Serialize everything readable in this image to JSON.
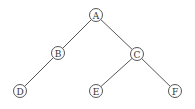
{
  "diagram": {
    "type": "binary-tree",
    "nodes": [
      {
        "id": "A",
        "label": "A"
      },
      {
        "id": "B",
        "label": "B"
      },
      {
        "id": "C",
        "label": "C"
      },
      {
        "id": "D",
        "label": "D"
      },
      {
        "id": "E",
        "label": "E"
      },
      {
        "id": "F",
        "label": "F"
      }
    ],
    "edges": [
      {
        "from": "A",
        "to": "B"
      },
      {
        "from": "A",
        "to": "C"
      },
      {
        "from": "B",
        "to": "D"
      },
      {
        "from": "C",
        "to": "E"
      },
      {
        "from": "C",
        "to": "F"
      }
    ]
  }
}
